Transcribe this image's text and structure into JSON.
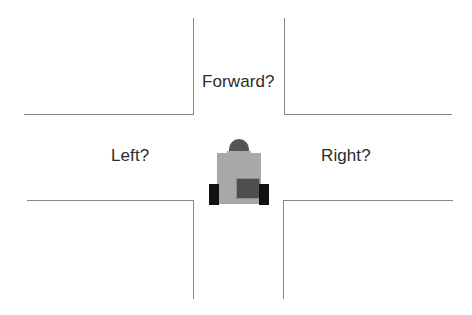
{
  "scene": {
    "title": "Robot at crossroads intersection",
    "background_color": "#ffffff",
    "width": 472,
    "height": 315
  },
  "road": {
    "line_color": "#878787",
    "description": "Four-way intersection formed by two vertical and two horizontal road edges",
    "segments": [
      {
        "name": "top-left-vertical",
        "orientation": "vertical"
      },
      {
        "name": "top-left-horizontal",
        "orientation": "horizontal"
      },
      {
        "name": "top-right-vertical",
        "orientation": "vertical"
      },
      {
        "name": "top-right-horizontal",
        "orientation": "horizontal"
      },
      {
        "name": "bottom-left-horizontal",
        "orientation": "horizontal"
      },
      {
        "name": "bottom-left-vertical",
        "orientation": "vertical"
      },
      {
        "name": "bottom-right-horizontal",
        "orientation": "horizontal"
      },
      {
        "name": "bottom-right-vertical",
        "orientation": "vertical"
      }
    ]
  },
  "labels": {
    "forward": "Forward?",
    "left": "Left?",
    "right": "Right?",
    "text_color": "#2b2b2b"
  },
  "robot": {
    "name": "robot",
    "head_color": "#555555",
    "body_color": "#a8a8a8",
    "screen_color": "#4e4e4e",
    "foot_color": "#111111"
  }
}
